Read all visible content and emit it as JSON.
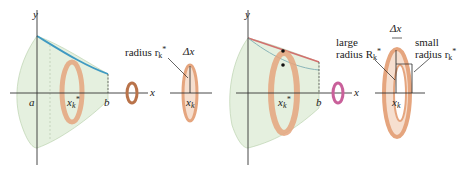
{
  "left_figure": {
    "axis_y": "y",
    "axis_x": "x",
    "label_a": "a",
    "label_b": "b",
    "label_xk": "x",
    "label_xk_sub": "k",
    "label_star": "*",
    "radius_label": "radius r",
    "radius_sub": "k",
    "delta_x": "Δx",
    "disk_xk": "x",
    "disk_xk_sub": "k"
  },
  "right_figure": {
    "axis_y": "y",
    "axis_x": "x",
    "label_b": "b",
    "label_xk": "x",
    "label_xk_sub": "k",
    "large_line1": "large",
    "large_line2": "radius R",
    "large_sub": "k",
    "small_line1": "small",
    "small_line2": "radius r",
    "small_sub": "k",
    "delta_x": "Δx",
    "washer_xk": "x",
    "washer_xk_sub": "k",
    "star": "*"
  },
  "colors": {
    "solid_fill": "#e3efdc",
    "curve_blue": "#3f9ac2",
    "curve_red": "#d2706e",
    "disk_orange": "#e5a57e",
    "rotation_arrow_left": "#b9734a",
    "rotation_arrow_right": "#c9609a"
  }
}
